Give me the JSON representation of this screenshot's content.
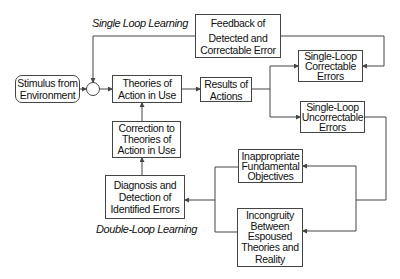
{
  "labels": {
    "single_loop": "Single Loop Learning",
    "double_loop": "Double-Loop Learning"
  },
  "nodes": {
    "stimulus": [
      "Stimulus from",
      "Environment"
    ],
    "feedback": [
      "Feedback of",
      "Detected and",
      "Correctable Error"
    ],
    "theories": [
      "Theories of",
      "Action in Use"
    ],
    "results": [
      "Results of",
      "Actions"
    ],
    "sl_correctable": [
      "Single-Loop",
      "Correctable",
      "Errors"
    ],
    "sl_uncorrectable": [
      "Single-Loop",
      "Uncorrectable",
      "Errors"
    ],
    "correction": [
      "Correction to",
      "Theories of",
      "Action in Use"
    ],
    "diagnosis": [
      "Diagnosis and",
      "Detection of",
      "Identified  Errors"
    ],
    "inappropriate": [
      "Inappropriate",
      "Fundamental",
      "Objectives"
    ],
    "incongruity": [
      "Incongruity",
      "Between",
      "Espoused",
      "Theories and",
      "Reality"
    ]
  },
  "colors": {
    "line": "#444444",
    "text": "#111111",
    "background": "#ffffff"
  }
}
